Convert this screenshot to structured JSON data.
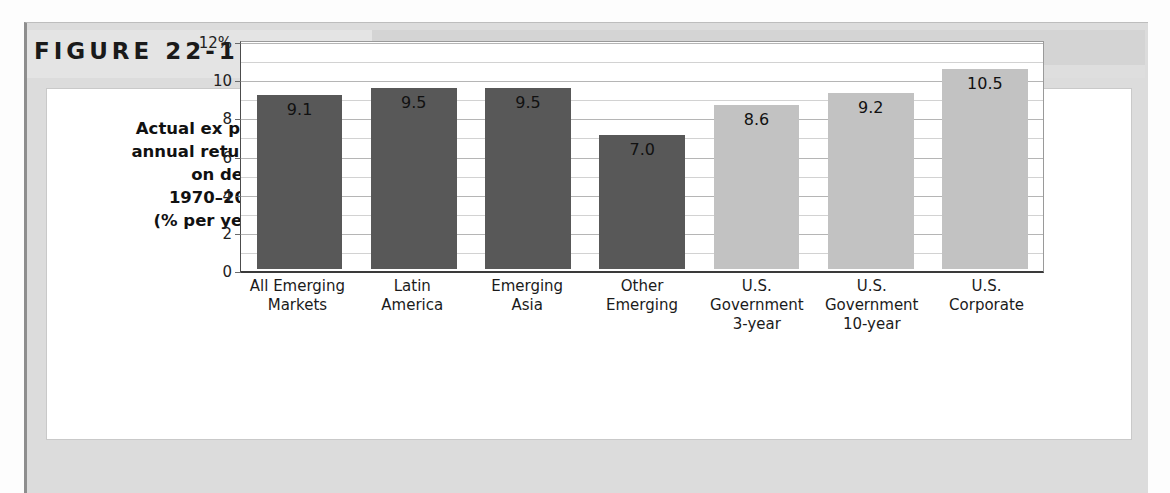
{
  "figure": {
    "label": "FIGURE 22-11"
  },
  "axis_title_lines": [
    "Actual ex post",
    "annual returns",
    "on debt,",
    "1970–2000",
    "(% per year)"
  ],
  "colors": {
    "emerging_bar": "#585858",
    "us_bar": "#c2c2c2",
    "banner": "#d4d4d4",
    "panel": "#dcdcdc",
    "card": "#ffffff"
  },
  "chart_data": {
    "type": "bar",
    "title": "FIGURE 22-11",
    "xlabel": "",
    "ylabel": "Actual ex post annual returns on debt, 1970–2000 (% per year)",
    "ylim": [
      0,
      12
    ],
    "ytick_labels": [
      "12%",
      "10",
      "8",
      "6",
      "4",
      "2",
      "0"
    ],
    "ytick_values": [
      12,
      10,
      8,
      6,
      4,
      2,
      0
    ],
    "minor_ticks": [
      11,
      9,
      7,
      5,
      3,
      1
    ],
    "grid": true,
    "legend": "none",
    "value_label_position": "inside-top",
    "categories": [
      [
        "All Emerging",
        "Markets"
      ],
      [
        "Latin",
        "America"
      ],
      [
        "Emerging",
        "Asia"
      ],
      [
        "Other",
        "Emerging"
      ],
      [
        "U.S.",
        "Government",
        "3-year"
      ],
      [
        "U.S.",
        "Government",
        "10-year"
      ],
      [
        "U.S.",
        "Corporate"
      ]
    ],
    "values": [
      9.1,
      9.5,
      9.5,
      7.0,
      8.6,
      9.2,
      10.5
    ],
    "value_labels": [
      "9.1",
      "9.5",
      "9.5",
      "7.0",
      "8.6",
      "9.2",
      "10.5"
    ],
    "groups": [
      "emerging",
      "emerging",
      "emerging",
      "emerging",
      "us",
      "us",
      "us"
    ]
  }
}
